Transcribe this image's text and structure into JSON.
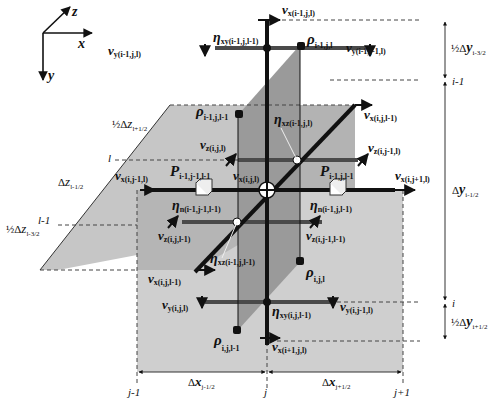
{
  "axes_legend": {
    "z": "z",
    "x": "x",
    "y": "y"
  },
  "grid_labels": {
    "i_minus_1": "i-1",
    "i": "i",
    "j_minus_1": "j-1",
    "j": "j",
    "j_plus_1": "j+1",
    "l": "l",
    "l_minus_1": "l-1"
  },
  "dimensions": {
    "half_dy_i_m32": {
      "prefix": "½Δ",
      "var": "y",
      "sub": "i-3/2"
    },
    "dy_i_m12": {
      "prefix": "Δ",
      "var": "y",
      "sub": "i-1/2"
    },
    "half_dy_i_p12": {
      "prefix": "½Δ",
      "var": "y",
      "sub": "i+1/2"
    },
    "dx_j_m12": {
      "prefix": "Δ",
      "var": "x",
      "sub": "j-1/2"
    },
    "dx_j_p12": {
      "prefix": "Δ",
      "var": "x",
      "sub": "j+1/2"
    },
    "half_dz_l_p12": {
      "prefix": "½Δ",
      "var": "z",
      "sub": "l+1/2"
    },
    "dz_l_m12": {
      "prefix": "Δ",
      "var": "z",
      "sub": "l-1/2"
    },
    "half_dz_l_m32": {
      "prefix": "½Δ",
      "var": "z",
      "sub": "l-3/2"
    }
  },
  "nodes": {
    "vx_im1_j_l": {
      "sym": "v",
      "comp": "x",
      "idx": "(i-1,j,l)"
    },
    "rho_im1_j_l": {
      "sym": "ρ",
      "idx": "i-1,j,l"
    },
    "vy_im1_j_l": {
      "sym": "v",
      "comp": "y",
      "idx": "(i-1,j,l)"
    },
    "eta_xy_im1_j_lm1": {
      "sym": "η",
      "comp": "xy",
      "idx": "(i-1,j,l-1)"
    },
    "vy_im1_jm1_l": {
      "sym": "v",
      "comp": "y",
      "idx": "(i-1,j-1,l)"
    },
    "rho_im1_j_lm1": {
      "sym": "ρ",
      "idx": "i-1,j,l-1"
    },
    "eta_xz_im1_j_l": {
      "sym": "η",
      "comp": "xz",
      "idx": "(i-1,j,l)"
    },
    "vx_i_j_lm1_top": {
      "sym": "v",
      "comp": "x",
      "idx": "(i,j,l-1)"
    },
    "vz_i_j_l": {
      "sym": "v",
      "comp": "z",
      "idx": "(i,j,l)"
    },
    "vz_i_jm1_l": {
      "sym": "v",
      "comp": "z",
      "idx": "(i,j-1,l)"
    },
    "vx_i_jm1_l": {
      "sym": "v",
      "comp": "x",
      "idx": "(i,j-1,l)"
    },
    "P_im1_jm1_lm1": {
      "sym": "P",
      "idx": "i-1,j-1,l-1"
    },
    "vx_i_j_l": {
      "sym": "v",
      "comp": "x",
      "idx": "(i,j,l)"
    },
    "P_im1_j_lm1": {
      "sym": "P",
      "idx": "i-1,j,l-1"
    },
    "vx_i_jp1_l": {
      "sym": "v",
      "comp": "x",
      "idx": "(i,j+1,l)"
    },
    "eta_n_im1_jm1_lm1": {
      "sym": "η",
      "comp": "n",
      "idx": "(i-1,j-1,l-1)"
    },
    "eta_n_im1_j_lm1": {
      "sym": "η",
      "comp": "n",
      "idx": "(i-1,j,l-1)"
    },
    "vz_i_j_lm1": {
      "sym": "v",
      "comp": "z",
      "idx": "(i,j,l-1)"
    },
    "vz_i_jm1_lm1": {
      "sym": "v",
      "comp": "z",
      "idx": "(i,j-1,l-1)"
    },
    "eta_xz_im1_j_lm1": {
      "sym": "η",
      "comp": "xz",
      "idx": "(i-1,j,l-1)"
    },
    "vx_i_j_lm1": {
      "sym": "v",
      "comp": "x",
      "idx": "(i,j,l-1)"
    },
    "rho_i_j_l": {
      "sym": "ρ",
      "idx": "i,j,l"
    },
    "vy_i_j_l": {
      "sym": "v",
      "comp": "y",
      "idx": "(i,j,l)"
    },
    "eta_xy_i_j_lm1": {
      "sym": "η",
      "comp": "xy",
      "idx": "(i,j,l-1)"
    },
    "vy_i_jm1_l": {
      "sym": "v",
      "comp": "y",
      "idx": "(i,j-1,l)"
    },
    "rho_i_j_lm1": {
      "sym": "ρ",
      "idx": "i,j,l-1"
    },
    "vx_ip1_j_l": {
      "sym": "v",
      "comp": "x",
      "idx": "(i+1,j,l)"
    }
  },
  "colors": {
    "plane_light": "#c9c9c9",
    "plane_mid": "#a9a9a9",
    "plane_dark": "#8c8c8c",
    "line": "#111111",
    "bar": "#4a4a4a"
  }
}
